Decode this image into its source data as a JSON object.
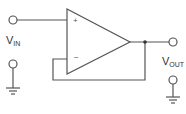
{
  "diagram": {
    "type": "op-amp voltage follower (unity gain buffer)",
    "input_label": {
      "main": "V",
      "sub": "IN"
    },
    "output_label": {
      "main": "V",
      "sub": "OUT"
    },
    "opamp": {
      "plus_sign": "+",
      "minus_sign": "−"
    },
    "colors": {
      "stroke": "#555555",
      "text": "#333333",
      "background": "#ffffff"
    }
  }
}
